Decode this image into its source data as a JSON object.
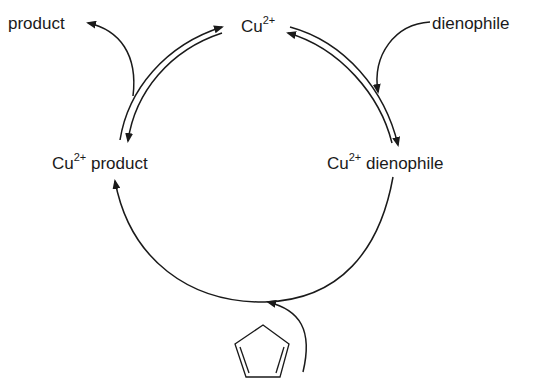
{
  "diagram": {
    "type": "catalytic-cycle",
    "nodes": {
      "catalyst": {
        "base": "Cu",
        "charge": "2+",
        "suffix": ""
      },
      "complex_dienophile": {
        "base": "Cu",
        "charge": "2+",
        "suffix": " dienophile"
      },
      "complex_product": {
        "base": "Cu",
        "charge": "2+",
        "suffix": " product"
      }
    },
    "inputs": {
      "dienophile": "dienophile",
      "diene": "cyclopentadiene-structure"
    },
    "outputs": {
      "product": "product"
    },
    "colors": {
      "stroke": "#1a1a1a",
      "background": "#ffffff"
    }
  }
}
